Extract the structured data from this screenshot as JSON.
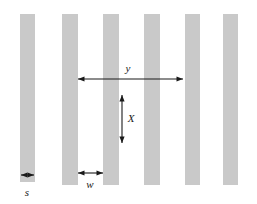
{
  "figure": {
    "background_color": "#ffffff",
    "width": 257,
    "height": 204
  },
  "bars": {
    "fill_color": "#c9c9c9",
    "count": 6,
    "items": [
      {
        "name": "bar-1",
        "x": 20,
        "y": 14,
        "width": 15,
        "height": 168
      },
      {
        "name": "bar-2",
        "x": 62,
        "y": 14,
        "width": 16,
        "height": 171
      },
      {
        "name": "bar-3",
        "x": 103,
        "y": 14,
        "width": 16,
        "height": 171
      },
      {
        "name": "bar-4",
        "x": 144,
        "y": 14,
        "width": 16,
        "height": 171
      },
      {
        "name": "bar-5",
        "x": 185,
        "y": 14,
        "width": 15,
        "height": 171
      },
      {
        "name": "bar-6",
        "x": 223,
        "y": 14,
        "width": 15,
        "height": 171
      }
    ]
  },
  "annotations": {
    "line_color": "#1a1a1a",
    "period": {
      "label": "y",
      "orientation": "horizontal",
      "x1": 78,
      "x2": 183,
      "y": 79,
      "label_x": 128,
      "label_y": 69
    },
    "depth": {
      "label": "X",
      "orientation": "vertical",
      "x": 122,
      "y1": 95,
      "y2": 143,
      "label_x": 131,
      "label_y": 119
    },
    "gap": {
      "label": "w",
      "orientation": "horizontal",
      "x1": 78,
      "x2": 103,
      "y": 173,
      "label_x": 90,
      "label_y": 185
    },
    "width": {
      "label": "s",
      "orientation": "horizontal",
      "x1": 21,
      "x2": 34,
      "y": 175,
      "label_x": 27,
      "label_y": 193
    }
  }
}
